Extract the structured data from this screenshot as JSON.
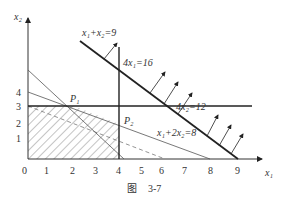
{
  "figure": {
    "caption_prefix": "图",
    "caption_number": "3-7"
  },
  "axes": {
    "x_label": "x₁",
    "y_label": "x₂",
    "x_ticks": [
      "0",
      "1",
      "2",
      "3",
      "4",
      "5",
      "6",
      "7",
      "8",
      "9"
    ],
    "y_ticks": [
      "1",
      "2",
      "3",
      "4"
    ]
  },
  "lines": {
    "objective": "x₁+x₂=9",
    "c1": "4x₁=16",
    "c2": "4x₂=12",
    "c3": "x₁+2x₂=8"
  },
  "points": {
    "p1": "P₁",
    "p2": "P₂"
  }
}
